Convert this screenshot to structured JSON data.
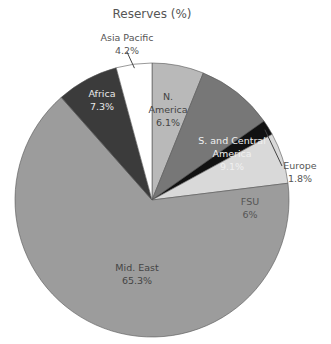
{
  "chart_data": {
    "type": "pie",
    "title": "Reserves (%)",
    "start": "top",
    "direction": "clockwise",
    "slices": [
      {
        "name": "N. America",
        "lines": [
          "N.",
          "America",
          "6.1%"
        ],
        "value": 6.1,
        "color": "#b9b9b9",
        "text_color": "#444444",
        "label_inside": true
      },
      {
        "name": "S. and Central America",
        "lines": [
          "S. and Central",
          "America",
          "9.1%"
        ],
        "value": 9.1,
        "color": "#777777",
        "text_color": "#f0f0f0",
        "label_inside": true
      },
      {
        "name": "Europe",
        "lines": [
          "Europe",
          "1.8%"
        ],
        "value": 1.8,
        "color": "#111111",
        "text_color": "#555555",
        "label_inside": false
      },
      {
        "name": "FSU",
        "lines": [
          "FSU",
          "6%"
        ],
        "value": 6.0,
        "color": "#d9d9d9",
        "text_color": "#555555",
        "label_inside": true
      },
      {
        "name": "Mid. East",
        "lines": [
          "Mid. East",
          "65.3%"
        ],
        "value": 65.3,
        "color": "#9c9c9c",
        "text_color": "#444444",
        "label_inside": true
      },
      {
        "name": "Africa",
        "lines": [
          "Africa",
          "7.3%"
        ],
        "value": 7.3,
        "color": "#3b3b3b",
        "text_color": "#e8e8e8",
        "label_inside": true
      },
      {
        "name": "Asia Pacific",
        "lines": [
          "Asia Pacific",
          "4.2%"
        ],
        "value": 4.2,
        "color": "#ffffff",
        "text_color": "#555555",
        "label_inside": false
      }
    ]
  }
}
